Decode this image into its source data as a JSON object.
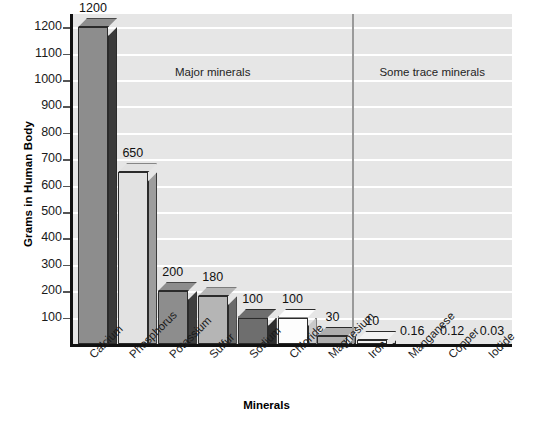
{
  "chart_data": {
    "type": "bar",
    "title": "",
    "xlabel": "Minerals",
    "ylabel": "Grams in Human Body",
    "ylim": [
      0,
      1250
    ],
    "grid": true,
    "legend": "none",
    "categories": [
      "Calcium",
      "Phosphorus",
      "Potassium",
      "Sulfur",
      "Sodium",
      "Chloride",
      "Magnesium",
      "Iron",
      "Manganese",
      "Copper",
      "Iodide"
    ],
    "values": [
      1200,
      650,
      200,
      180,
      100,
      100,
      30,
      10,
      0.16,
      0.12,
      0.03
    ],
    "value_labels": [
      "1200",
      "650",
      "200",
      "180",
      "100",
      "100",
      "30",
      "10",
      "0.16",
      "0.12",
      "0.03"
    ],
    "bar_colors": [
      "#8d8d8d",
      "#e2e2e2",
      "#8d8d8d",
      "#b5b5b5",
      "#6e6e6e",
      "#fdfdfd",
      "#aeaeae",
      "#f2f2f2",
      "#f2f2f2",
      "#f2f2f2",
      "#f2f2f2"
    ],
    "bar_side_colors": [
      "#3a3a3a",
      "#9d9d9d",
      "#3f3f3f",
      "#6a6a6a",
      "#2e2e2e",
      "#c9c9c9",
      "#7a7a7a",
      "#c9c9c9",
      "#c9c9c9",
      "#c9c9c9",
      "#c9c9c9"
    ],
    "yticks": [
      100,
      200,
      300,
      400,
      500,
      600,
      700,
      800,
      900,
      1000,
      1100,
      1200
    ],
    "ytick_labels": [
      "100",
      "200",
      "300",
      "400",
      "500",
      "600",
      "700",
      "800",
      "900",
      "1000",
      "1100",
      "1200"
    ],
    "annotations": [
      {
        "text": "Major minerals",
        "group": "major"
      },
      {
        "text": "Some trace minerals",
        "group": "trace"
      }
    ],
    "divider_after_category": "Magnesium",
    "plot_background": "#e6e6e6",
    "gridline_color": "#ffffff",
    "axis_color": "#111111",
    "divider_color": "#9a9a9a"
  }
}
